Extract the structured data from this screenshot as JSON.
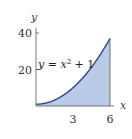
{
  "chart_data": {
    "type": "area",
    "title": "",
    "function": "y = x^2 + 1",
    "annotation": {
      "text_main": "y = x",
      "superscript": "2",
      "text_tail": " + 1"
    },
    "xlabel": "x",
    "ylabel": "y",
    "xlim": [
      0,
      6
    ],
    "ylim": [
      0,
      40
    ],
    "xticks": [
      3,
      6
    ],
    "xtick_labels": [
      "3",
      "6"
    ],
    "yticks": [
      20,
      40
    ],
    "ytick_labels": [
      "20",
      "40"
    ],
    "x": [
      0,
      0.5,
      1,
      1.5,
      2,
      2.5,
      3,
      3.5,
      4,
      4.5,
      5,
      5.5,
      6
    ],
    "values": [
      1,
      1.25,
      2,
      3.25,
      5,
      7.25,
      10,
      13.25,
      17,
      21.25,
      26,
      31.25,
      37
    ],
    "shaded_region": {
      "from_x": 0,
      "to_x": 6,
      "under": "curve"
    },
    "grid": false,
    "legend": null,
    "colors": {
      "curve": "#2b4a8a",
      "fill": "#b9cbe6",
      "axis": "#555555"
    }
  }
}
